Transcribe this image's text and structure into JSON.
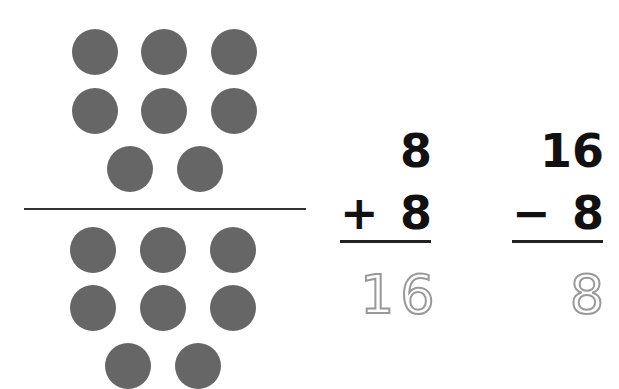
{
  "counters": {
    "color": "#666666",
    "top_group": {
      "rows": [
        3,
        3,
        2
      ],
      "count": 8
    },
    "bottom_group": {
      "rows": [
        3,
        3,
        2
      ],
      "count": 8
    }
  },
  "addition": {
    "top": "8",
    "operator": "+",
    "bottom": "8",
    "answer": "16"
  },
  "subtraction": {
    "top": "16",
    "operator": "−",
    "bottom": "8",
    "answer": "8"
  },
  "colors": {
    "ink": "#111111",
    "answer_trace": "#999999"
  }
}
